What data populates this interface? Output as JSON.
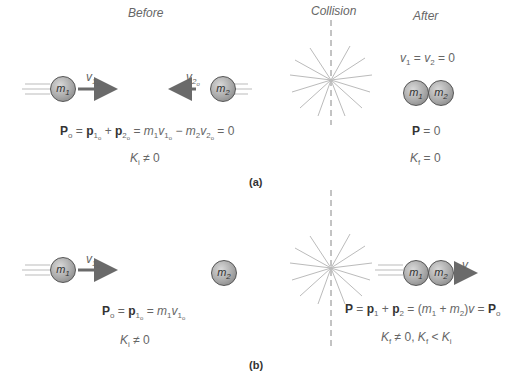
{
  "headers": {
    "before": "Before",
    "collision": "Collision",
    "after": "After"
  },
  "panel_a": {
    "label": "(a)",
    "ball1": "m1",
    "ball2": "m2",
    "v1_label": "v1o",
    "v2_label": "v2o",
    "eq_momentum_before": "Po = p1o + p2o = m1v1o − m2v2o = 0",
    "eq_ke_before": "Ki ≠ 0",
    "eq_velocity_after": "v1 = v2 = 0",
    "eq_momentum_after": "P = 0",
    "eq_ke_after": "Kf = 0"
  },
  "panel_b": {
    "label": "(b)",
    "ball1": "m1",
    "ball2": "m2",
    "v1_label": "v1o",
    "v_after_label": "v",
    "eq_momentum_before": "Po = p1o = m1v1o",
    "eq_ke_before": "Ki ≠ 0",
    "eq_momentum_after": "P = p1 + p2 = (m1 + m2)v = Po",
    "eq_ke_after": "Kf ≠ 0, Kf < Ki"
  },
  "colors": {
    "arrow": "#6a6a6a",
    "ball": "#a8a8a8",
    "burst": "#bbbbbb",
    "text": "#666666"
  }
}
